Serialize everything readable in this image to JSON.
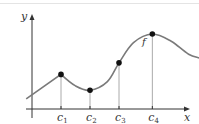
{
  "chart_data": {
    "type": "line",
    "title": "",
    "xlabel": "x",
    "ylabel": "y",
    "function_label": "f",
    "critical_points": [
      {
        "label": "c",
        "sub": "1",
        "x": 1.0,
        "y": 1.2
      },
      {
        "label": "c",
        "sub": "2",
        "x": 2.0,
        "y": 0.65
      },
      {
        "label": "c",
        "sub": "3",
        "x": 3.0,
        "y": 1.6
      },
      {
        "label": "c",
        "sub": "4",
        "x": 4.15,
        "y": 2.6
      },
      {
        "label": "c",
        "sub": "5",
        "x": 5.95,
        "y": 1.7
      }
    ],
    "curve": [
      {
        "x": -0.2,
        "y": 0.35
      },
      {
        "x": 1.0,
        "y": 1.2
      },
      {
        "x": 1.5,
        "y": 0.8
      },
      {
        "x": 2.0,
        "y": 0.65
      },
      {
        "x": 2.6,
        "y": 0.95
      },
      {
        "x": 3.0,
        "y": 1.6
      },
      {
        "x": 3.5,
        "y": 2.3
      },
      {
        "x": 4.15,
        "y": 2.6
      },
      {
        "x": 4.8,
        "y": 2.35
      },
      {
        "x": 5.4,
        "y": 1.9
      },
      {
        "x": 5.95,
        "y": 1.7
      },
      {
        "x": 6.4,
        "y": 1.4
      },
      {
        "x": 6.6,
        "y": 0.6
      }
    ],
    "xlim": [
      -1.5,
      7.3
    ],
    "ylim": [
      0,
      3.3
    ],
    "grid": false,
    "legend": "none"
  },
  "colors": {
    "curve": "#7a7a7a",
    "axis": "#333333",
    "point": "#111111",
    "dropline": "#aaaaaa"
  }
}
